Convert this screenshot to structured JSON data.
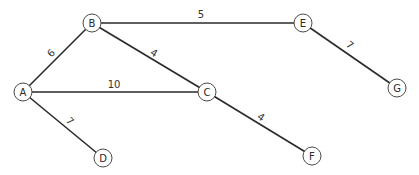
{
  "diagram": {
    "type": "weighted-undirected-graph",
    "node_radius": 9,
    "colors": {
      "background": "#ffffff",
      "edge": "#2a2a2a",
      "node_stroke": "#4a4a4a",
      "text": "#2a2a2a"
    },
    "nodes": [
      {
        "id": "A",
        "label": "A",
        "x": 23,
        "y": 92
      },
      {
        "id": "B",
        "label": "B",
        "x": 92,
        "y": 23
      },
      {
        "id": "C",
        "label": "C",
        "x": 207,
        "y": 92
      },
      {
        "id": "D",
        "label": "D",
        "x": 103,
        "y": 158
      },
      {
        "id": "E",
        "label": "E",
        "x": 303,
        "y": 23
      },
      {
        "id": "F",
        "label": "F",
        "x": 312,
        "y": 156
      },
      {
        "id": "G",
        "label": "G",
        "x": 397,
        "y": 88
      }
    ],
    "edges": [
      {
        "from": "A",
        "to": "B",
        "weight": "6",
        "label_x": 51,
        "label_y": 53,
        "rotate": -45
      },
      {
        "from": "B",
        "to": "E",
        "weight": "5",
        "label_x": 201,
        "label_y": 14,
        "rotate": 0
      },
      {
        "from": "B",
        "to": "C",
        "weight": "4",
        "label_x": 154,
        "label_y": 53,
        "rotate": 31
      },
      {
        "from": "A",
        "to": "C",
        "weight": "10",
        "label_x": 114,
        "label_y": 84,
        "rotate": 0
      },
      {
        "from": "E",
        "to": "G",
        "weight": "7",
        "label_x": 350,
        "label_y": 45,
        "rotate": 38
      },
      {
        "from": "A",
        "to": "D",
        "weight": "7",
        "label_x": 70,
        "label_y": 121,
        "rotate": 45
      },
      {
        "from": "C",
        "to": "F",
        "weight": "4",
        "label_x": 261,
        "label_y": 117,
        "rotate": 33
      }
    ]
  }
}
